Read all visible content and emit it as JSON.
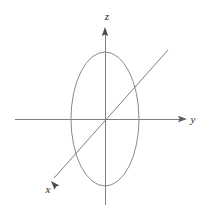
{
  "figure": {
    "canvas": {
      "width": 205,
      "height": 219,
      "background": "#ffffff"
    },
    "stroke_color": "#808080",
    "label_color": "#2b2b2b",
    "stroke_width": 1,
    "origin": {
      "x": 105,
      "y": 119
    }
  },
  "axes": [
    {
      "id": "x",
      "label": "x",
      "label_pos": {
        "x": 48,
        "y": 190
      },
      "line": {
        "x1": 168,
        "y1": 50,
        "x2": 54,
        "y2": 178
      },
      "arrow_at": "end",
      "arrow_tip": {
        "x": 51,
        "y": 181
      },
      "arrow_angle_deg": 228,
      "description": "diagonal axis running from upper-right to lower-left, arrowhead at lower-left"
    },
    {
      "id": "y",
      "label": "y",
      "label_pos": {
        "x": 193,
        "y": 120
      },
      "line": {
        "x1": 15,
        "y1": 119,
        "x2": 184,
        "y2": 119
      },
      "arrow_at": "end",
      "arrow_tip": {
        "x": 187,
        "y": 119
      },
      "arrow_angle_deg": 0,
      "description": "horizontal axis pointing right, arrowhead at right end"
    },
    {
      "id": "z",
      "label": "z",
      "label_pos": {
        "x": 107,
        "y": 17
      },
      "line": {
        "x1": 105,
        "y1": 205,
        "x2": 105,
        "y2": 32
      },
      "arrow_at": "end",
      "arrow_tip": {
        "x": 105,
        "y": 27
      },
      "arrow_angle_deg": 270,
      "description": "vertical axis pointing up, arrowhead at top"
    }
  ],
  "shapes": [
    {
      "id": "ellipse",
      "type": "ellipse",
      "name": "vertical-ellipse",
      "center": {
        "x": 105,
        "y": 119
      },
      "radius_x": 34,
      "radius_y": 67,
      "fill": "none",
      "stroke": "#8a8a8a",
      "description": "tall ellipse centered at the origin, lying in the yz-plane"
    }
  ],
  "chart_data": {
    "type": "scatter",
    "title": "",
    "xlabel": "x",
    "ylabel": "y",
    "zlabel": "z",
    "grid": false,
    "legend": null,
    "annotations": [
      "x",
      "y",
      "z"
    ],
    "series": [
      {
        "name": "ellipse",
        "shape": "ellipse",
        "center": [
          0,
          0
        ],
        "semi_axis_horizontal": 34,
        "semi_axis_vertical": 67
      }
    ]
  }
}
